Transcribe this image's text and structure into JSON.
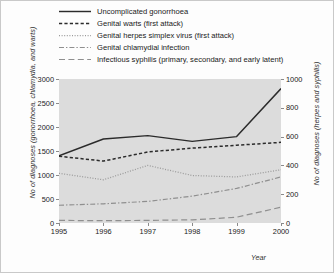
{
  "figure": {
    "background": "#fdfdfd",
    "plot_background": "#dcdcdc",
    "border_color": "#c9c9c9"
  },
  "axes": {
    "y_left_title": "No of diagnoses (gonorrhoea, chlamydia, and warts)",
    "y_right_title": "No of diagnoses (herpes and syphilis)",
    "x_title": "Year",
    "y_left_ticks": [
      "0",
      "500",
      "1000",
      "1500",
      "2000",
      "2500",
      "3000"
    ],
    "y_right_ticks": [
      "0",
      "200",
      "400",
      "600",
      "800",
      "1000"
    ],
    "x_ticks": [
      "1995",
      "1996",
      "1997",
      "1998",
      "1999",
      "2000"
    ]
  },
  "legend": [
    {
      "label": "Uncomplicated gonorrhoea",
      "style": "solid",
      "color": "#2b2b2b"
    },
    {
      "label": "Genital warts (first attack)",
      "style": "dashed",
      "color": "#2b2b2b"
    },
    {
      "label": "Genital herpes simplex virus (first attack)",
      "style": "dotted",
      "color": "#9a9a9a"
    },
    {
      "label": "Genital chlamydial infection",
      "style": "dashdot",
      "color": "#8f8f8f"
    },
    {
      "label": "Infectious syphilis (primary, secondary, and early latent)",
      "style": "longdash",
      "color": "#8f8f8f"
    }
  ],
  "chart_data": {
    "type": "line",
    "title": "",
    "xlabel": "Year",
    "ylabel": "No of diagnoses (gonorrhoea, chlamydia, and warts)",
    "ylabel_secondary": "No of diagnoses (herpes and syphilis)",
    "x": [
      1995,
      1996,
      1997,
      1998,
      1999,
      2000
    ],
    "xlim": [
      1995,
      2000
    ],
    "ylim": [
      0,
      3000
    ],
    "ylim_secondary": [
      0,
      1000
    ],
    "grid": false,
    "legend_position": "top",
    "series": [
      {
        "name": "Uncomplicated gonorrhoea",
        "axis": "left",
        "style": "solid",
        "values": [
          1400,
          1750,
          1820,
          1700,
          1800,
          2800
        ]
      },
      {
        "name": "Genital warts (first attack)",
        "axis": "left",
        "style": "dashed",
        "values": [
          1390,
          1290,
          1480,
          1560,
          1620,
          1680
        ]
      },
      {
        "name": "Genital herpes simplex virus (first attack)",
        "axis": "right",
        "style": "dotted",
        "values": [
          345,
          300,
          400,
          330,
          320,
          370
        ]
      },
      {
        "name": "Genital chlamydial infection",
        "axis": "left",
        "style": "dashdot",
        "values": [
          370,
          400,
          450,
          560,
          720,
          960
        ]
      },
      {
        "name": "Infectious syphilis (primary, secondary, and early latent)",
        "axis": "right",
        "style": "longdash",
        "values": [
          18,
          16,
          18,
          22,
          40,
          110
        ]
      }
    ]
  }
}
